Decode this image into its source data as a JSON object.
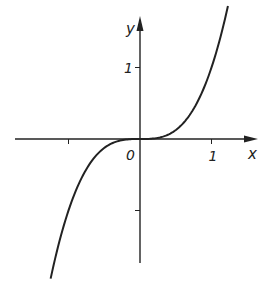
{
  "chart_data": {
    "type": "line",
    "title": "",
    "function": "y = x^3",
    "xlabel": "x",
    "ylabel": "y",
    "xlim": [
      -1.75,
      1.65
    ],
    "ylim": [
      -1.7,
      1.7
    ],
    "grid": false,
    "legend": "none",
    "origin_label": "0",
    "x_ticks": [
      {
        "value": -1,
        "label": ""
      },
      {
        "value": 1,
        "label": "1"
      }
    ],
    "y_ticks": [
      {
        "value": 1,
        "label": "1"
      },
      {
        "value": -1,
        "label": ""
      }
    ],
    "series": [
      {
        "name": "x^3",
        "x_range": [
          -1.25,
          1.23
        ],
        "color": "#222222"
      }
    ]
  }
}
